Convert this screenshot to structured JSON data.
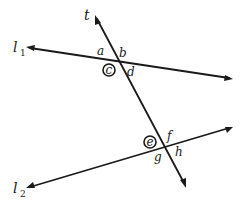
{
  "diagram": {
    "lines": {
      "transversal": {
        "label": "t"
      },
      "l1": {
        "label": "l",
        "subscript": "1"
      },
      "l2": {
        "label": "l",
        "subscript": "2"
      }
    },
    "angles": {
      "top_intersection": [
        {
          "label": "a",
          "circled": false
        },
        {
          "label": "b",
          "circled": false
        },
        {
          "label": "c",
          "circled": true
        },
        {
          "label": "d",
          "circled": false
        }
      ],
      "bottom_intersection": [
        {
          "label": "e",
          "circled": true
        },
        {
          "label": "f",
          "circled": false
        },
        {
          "label": "g",
          "circled": false
        },
        {
          "label": "h",
          "circled": false
        }
      ]
    },
    "colors": {
      "ink": "#1a1a1a",
      "background": "#ffffff"
    }
  }
}
